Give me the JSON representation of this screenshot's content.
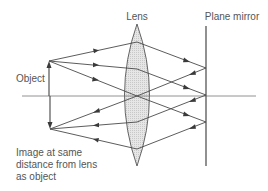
{
  "diagram": {
    "labels": {
      "lens": "Lens",
      "mirror": "Plane mirror",
      "object": "Object",
      "image_line1": "Image at same",
      "image_line2": "distance from lens",
      "image_line3": "as object"
    },
    "elements": {
      "optical_axis": {
        "x1": 22,
        "x2": 256,
        "y": 96
      },
      "lens": {
        "cx": 137,
        "top": 24,
        "bottom": 166,
        "half_width": 13,
        "fill": "#dcdcdc"
      },
      "mirror": {
        "x": 206,
        "top": 26,
        "bottom": 166
      },
      "object_arrow": {
        "x": 49,
        "base_y": 96,
        "tip_y": 61,
        "direction": "up"
      },
      "image_arrow": {
        "x": 50,
        "base_y": 96,
        "tip_y": 129,
        "direction": "down"
      }
    },
    "rays_outgoing": [
      {
        "from": [
          49,
          61
        ],
        "via_lens": [
          137,
          42
        ],
        "to_mirror": [
          206,
          68
        ]
      },
      {
        "from": [
          49,
          61
        ],
        "via_lens": [
          137,
          69
        ],
        "to_mirror": [
          206,
          95
        ]
      },
      {
        "from": [
          49,
          61
        ],
        "via_lens": [
          137,
          96
        ],
        "to_mirror": [
          206,
          122
        ]
      }
    ],
    "rays_returning": [
      {
        "from_mirror": [
          206,
          68
        ],
        "via_lens": [
          137,
          96
        ],
        "to_image": [
          50,
          129
        ]
      },
      {
        "from_mirror": [
          206,
          95
        ],
        "via_lens": [
          137,
          122
        ],
        "to_image": [
          50,
          129
        ]
      },
      {
        "from_mirror": [
          206,
          122
        ],
        "via_lens": [
          137,
          149
        ],
        "to_image": [
          50,
          129
        ]
      }
    ]
  }
}
